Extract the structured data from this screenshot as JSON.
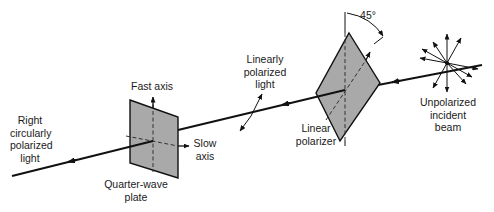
{
  "diagram": {
    "colors": {
      "ink": "#111111",
      "plate_fill": "#a9a9a9",
      "background": "#ffffff"
    },
    "labels": {
      "output_light": [
        "Right",
        "circularly",
        "polarized",
        "light"
      ],
      "fast_axis": "Fast axis",
      "slow_axis": [
        "Slow",
        "axis"
      ],
      "quarter_wave_plate": [
        "Quarter-wave",
        "plate"
      ],
      "linearly_polarized": [
        "Linearly",
        "polarized",
        "light"
      ],
      "angle": "45°",
      "linear_polarizer": [
        "Linear",
        "polarizer"
      ],
      "incident_beam": [
        "Unpolarized",
        "incident",
        "beam"
      ]
    },
    "components": [
      {
        "id": "unpolarized-source",
        "label": "Unpolarized incident beam"
      },
      {
        "id": "linear-polarizer",
        "label": "Linear polarizer",
        "axis_angle_deg": 45
      },
      {
        "id": "linearly-polarized-light",
        "label": "Linearly polarized light"
      },
      {
        "id": "quarter-wave-plate",
        "label": "Quarter-wave plate",
        "axes": [
          "Fast axis",
          "Slow axis"
        ]
      },
      {
        "id": "output",
        "label": "Right circularly polarized light"
      }
    ],
    "flow": [
      "unpolarized-source",
      "linear-polarizer",
      "linearly-polarized-light",
      "quarter-wave-plate",
      "output"
    ]
  }
}
